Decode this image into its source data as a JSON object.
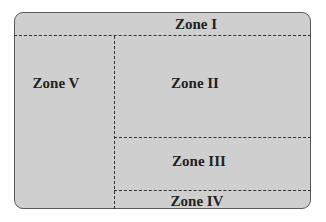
{
  "colors": {
    "fill": "#cfcfcf",
    "border": "#5a5a5a",
    "lines": "#333333",
    "text": "#222222"
  },
  "zones": {
    "zone1": "Zone I",
    "zone2": "Zone II",
    "zone3": "Zone III",
    "zone4": "Zone IV",
    "zone5": "Zone V"
  }
}
